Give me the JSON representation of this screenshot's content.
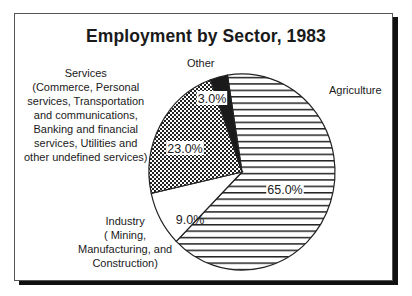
{
  "chart_data": {
    "type": "pie",
    "title": "Employment by Sector, 1983",
    "slices": [
      {
        "label": "Agriculture",
        "value": 65.0,
        "pct_label": "65.0%",
        "pattern": "horizontal-lines"
      },
      {
        "label": "Industry\n( Mining,\nManufacturing, and\nConstruction)",
        "value": 9.0,
        "pct_label": "9.0%",
        "pattern": "white"
      },
      {
        "label": "Services\n(Commerce, Personal\nservices, Transportation\nand communications,\nBanking and financial\nservices, Utilities and\nother undefined services)",
        "value": 23.0,
        "pct_label": "23.0%",
        "pattern": "checkerboard"
      },
      {
        "label": "Other",
        "value": 3.0,
        "pct_label": "3.0%",
        "pattern": "solid-black"
      }
    ],
    "start_angle_deg": -9,
    "direction": "clockwise",
    "legend": "none (direct labels)"
  },
  "labels": {
    "title": "Employment by Sector, 1983",
    "agriculture": "Agriculture",
    "industry": "Industry\n( Mining,\nManufacturing, and\nConstruction)",
    "services": "Services\n(Commerce, Personal\nservices, Transportation\nand communications,\nBanking and financial\nservices, Utilities and\nother undefined services)",
    "other": "Other",
    "pct_agriculture": "65.0%",
    "pct_industry": "9.0%",
    "pct_services": "23.0%",
    "pct_other": "3.0%"
  }
}
